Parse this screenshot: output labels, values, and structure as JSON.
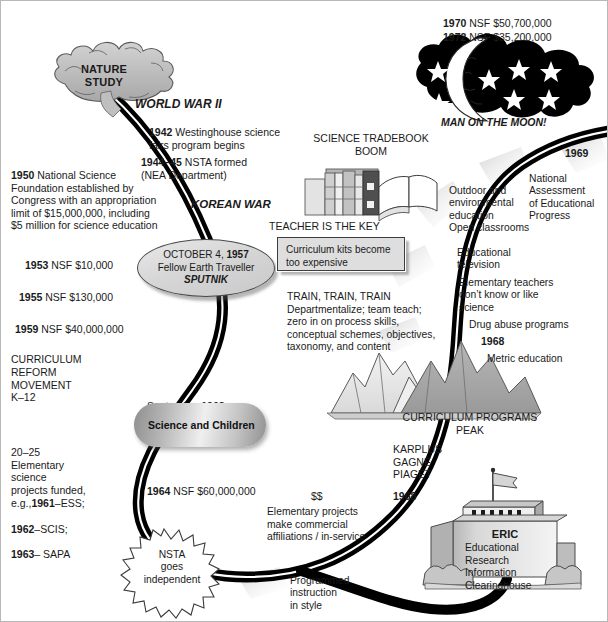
{
  "graphics": {
    "nature_study_label": "NATURE\nSTUDY",
    "moon_caption": "MAN ON THE MOON!",
    "tradebook_label": "SCIENCE TRADEBOOK\nBOOM",
    "mountain_label": "CURRICULUM PROGRAMS\nPEAK",
    "starburst_label": "NSTA\ngoes\nindependent",
    "eric_acronym": "ERIC",
    "eric_expansion": "Educational\nResearch\nInformation\nClearinghouse"
  },
  "left_column": {
    "nsf_1950": {
      "year": "1950",
      "text": " National Science\nFoundation established by\nCongress with an appropriation\nlimit of $15,000,000, including\n$5 million for science education"
    },
    "nsf_1953": {
      "year": "1953",
      "text": " NSF $10,000"
    },
    "nsf_1955": {
      "year": "1955",
      "text": " NSF $130,000"
    },
    "nsf_1959": {
      "year": "1959",
      "text": " NSF $40,000,000"
    },
    "curriculum_reform": "CURRICULUM\nREFORM\nMOVEMENT\nK–12",
    "projects_funded_head": "20–25\nElementary\nscience\nprojects funded,\ne.g.,",
    "projects_funded_items": [
      {
        "year": "1961",
        "text": "–ESS;"
      },
      {
        "year": "1962",
        "text": "–SCIS;"
      },
      {
        "year": "1963",
        "text": "– SAPA"
      }
    ]
  },
  "upper_middle": {
    "world_war_ii": "WORLD WAR II",
    "westinghouse": {
      "year": "1942",
      "text": " Westinghouse science\n          fairs program begins"
    },
    "nsta_formed": {
      "year": "1944–45",
      "text": " NSTA formed\n(NEA Department)"
    },
    "korean_war": "KOREAN WAR"
  },
  "center": {
    "sputnik": {
      "line1_pre": "OCTOBER 4, ",
      "line1_year": "1957",
      "line2": "Fellow Earth Traveller",
      "line3": "SPUTNIK"
    },
    "september_pre": "September ",
    "september_year": "1963",
    "journal_pill": "Science and Children",
    "nsf_1964": {
      "year": "1964",
      "text": " NSF $60,000,000"
    }
  },
  "middle_right": {
    "teacher_is_key": "TEACHER IS THE KEY",
    "curriculum_kits": "Curriculum kits become\ntoo expensive",
    "train": "TRAIN, TRAIN, TRAIN\nDepartmentalize; team teach;\nzero in on process skills,\nconceptual schemes, objectives,\ntaxonomy, and content"
  },
  "top_right": {
    "nsf_1970": {
      "year": "1970",
      "text": " NSF $50,700,000"
    },
    "nsf_1972": {
      "year": "1972",
      "text": " NSF $35,200,000"
    }
  },
  "right_column": {
    "year_1969": "1969",
    "naep": "National\nAssessment\nof Educational\nProgress",
    "outdoor": "Outdoor and\nenvironmental\neducation\nOpen classrooms",
    "ed_tv": "Educational\ntelevision",
    "elem_teachers": "Elementary teachers\ndon’t know or like\nscience",
    "drug_abuse": "Drug abuse programs",
    "year_1968_upper": "1968",
    "metric": "Metric education"
  },
  "lower": {
    "theorists": "KARPLUS\nGAGNE\nPIAGET",
    "year_1968_lower": "1968",
    "dollars": "$$",
    "commercial": "Elementary projects\nmake commercial\naffiliations / in-service",
    "programmed": "Programmed\ninstruction\nin style"
  },
  "colors": {
    "ink": "#1a1a1a",
    "road": "#000000",
    "paper": "#ffffff",
    "gray_fill": "#c9c9c9",
    "gray_dark": "#8c8c8c",
    "gray_light": "#e6e6e6"
  }
}
